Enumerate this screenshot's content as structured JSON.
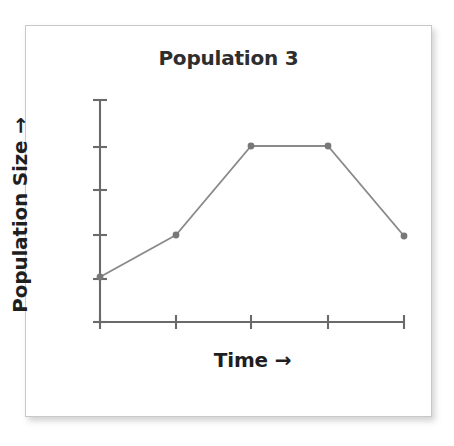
{
  "card": {
    "background_color": "#ffffff",
    "border_color": "#c8c8c8"
  },
  "chart_data": {
    "type": "line",
    "title": "Population 3",
    "xlabel": "Time →",
    "ylabel": "Population Size →",
    "axis_color": "#6a6a6a",
    "line_color": "#8a8a8a",
    "marker_color": "#787878",
    "grid": false,
    "legend": null,
    "x_tick_labels": [
      "",
      "",
      "",
      "",
      ""
    ],
    "y_tick_labels": [
      "",
      "",
      "",
      "",
      ""
    ],
    "xlim": [
      0,
      4
    ],
    "ylim": [
      0,
      5
    ],
    "x": [
      0,
      1,
      2,
      3,
      4
    ],
    "values": [
      1.0,
      1.95,
      3.95,
      3.95,
      1.93
    ],
    "series": [
      {
        "name": "Population 3",
        "x": [
          0,
          1,
          2,
          3,
          4
        ],
        "values": [
          1.0,
          1.95,
          3.95,
          3.95,
          1.93
        ]
      }
    ],
    "annotations": []
  },
  "geometry": {
    "plot_left_px": 100,
    "plot_bottom_px": 322,
    "plot_top_px": 100,
    "plot_right_px": 404,
    "x_tick_px": [
      100,
      176,
      251,
      328,
      404
    ],
    "y_tick_px": [
      322,
      279,
      235,
      190,
      147,
      100
    ],
    "point_px": [
      {
        "x": 100,
        "y": 277
      },
      {
        "x": 176,
        "y": 235
      },
      {
        "x": 251,
        "y": 146
      },
      {
        "x": 328,
        "y": 146
      },
      {
        "x": 404,
        "y": 236
      }
    ]
  }
}
